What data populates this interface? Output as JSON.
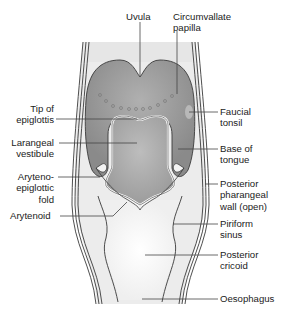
{
  "diagram": {
    "colors": {
      "background": "#ffffff",
      "pharynx_fill": "#ededed",
      "tongue_fill": "#8f8f8f",
      "vestibule_fill": "#a6a6a6",
      "outline": "#3a3a3a",
      "leader_line": "#444444",
      "text": "#222222"
    },
    "labels": {
      "uvula": "Uvula",
      "circumvallate_1": "Circumvallate",
      "circumvallate_2": "papilla",
      "tip_epiglottis_1": "Tip of",
      "tip_epiglottis_2": "epiglottis",
      "laryngeal_vestibule_1": "Larangeal",
      "laryngeal_vestibule_2": "vestibule",
      "aryepiglottic_1": "Aryteno-",
      "aryepiglottic_2": "epiglottic",
      "aryepiglottic_3": "fold",
      "arytenoid": "Arytenoid",
      "faucial_tonsil_1": "Faucial",
      "faucial_tonsil_2": "tonsil",
      "base_tongue_1": "Base of",
      "base_tongue_2": "tongue",
      "posterior_wall_1": "Posterior",
      "posterior_wall_2": "pharangeal",
      "posterior_wall_3": "wall (open)",
      "piriform_1": "Piriform",
      "piriform_2": "sinus",
      "posterior_cricoid_1": "Posterior",
      "posterior_cricoid_2": "cricoid",
      "oesophagus": "Oesophagus"
    }
  }
}
